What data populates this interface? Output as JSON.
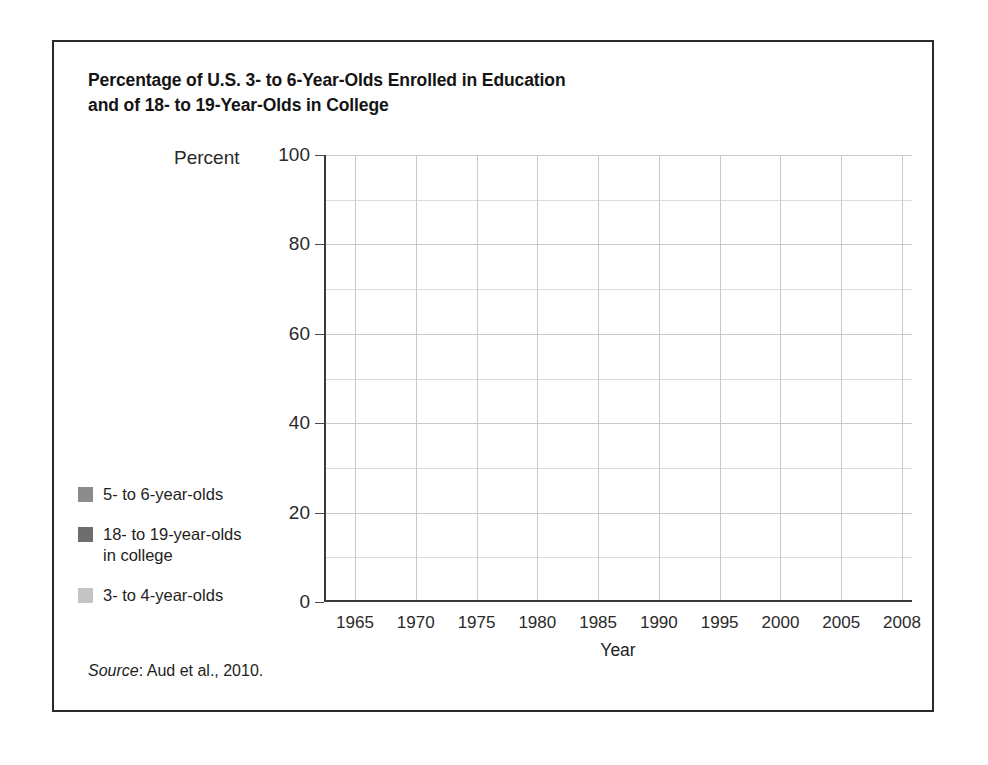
{
  "title": {
    "line1": "Percentage of U.S. 3- to 6-Year-Olds Enrolled in Education",
    "line2": "and of 18- to 19-Year-Olds in College"
  },
  "axis": {
    "y_header": "Percent",
    "x_title": "Year"
  },
  "source": {
    "label": "Source",
    "separator": ": ",
    "citation": "Aud et al., 2010."
  },
  "legend": {
    "items": [
      {
        "label": "5- to 6-year-olds",
        "color": "#8c8c8c",
        "series": "5_to_6"
      },
      {
        "label": "18- to 19-year-olds\nin college",
        "line1": "18- to 19-year-olds",
        "line2": "in college",
        "color": "#6e6e6e",
        "series": "18_to_19"
      },
      {
        "label": "3- to 4-year-olds",
        "color": "#c4c4c4",
        "series": "3_to_4"
      }
    ]
  },
  "chart_data": {
    "type": "line",
    "title": "Percentage of U.S. 3- to 6-Year-Olds Enrolled in Education and of 18- to 19-Year-Olds in College",
    "xlabel": "Year",
    "ylabel": "Percent",
    "categories": [
      "1965",
      "1970",
      "1975",
      "1980",
      "1985",
      "1990",
      "1995",
      "2000",
      "2005",
      "2008"
    ],
    "ylim": [
      0,
      100
    ],
    "yticks": [
      0,
      20,
      40,
      60,
      80,
      100
    ],
    "y_minor_ticks": [
      10,
      30,
      50,
      70,
      90
    ],
    "grid": true,
    "legend_position": "left-outside",
    "series": [
      {
        "name": "5- to 6-year-olds",
        "color": "#8c8c8c",
        "values": [
          85,
          89.5,
          94.8,
          95.2,
          95.6,
          97.2,
          96.0,
          97.3,
          96.5,
          95.5
        ]
      },
      {
        "name": "18- to 19-year-olds in college",
        "color": "#6e6e6e",
        "values": [
          35.8,
          36.5,
          37.0,
          36.2,
          39.5,
          43.0,
          43.3,
          45.3,
          49.5,
          49.6
        ]
      },
      {
        "name": "3- to 4-year-olds",
        "color": "#c4c4c4",
        "values": [
          10.5,
          20.5,
          31.0,
          36.7,
          39.0,
          44.4,
          48.7,
          52.1,
          54.5,
          53.6
        ]
      }
    ]
  }
}
